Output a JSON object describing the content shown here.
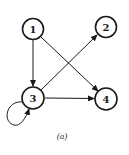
{
  "diagram": {
    "type": "directed-graph",
    "caption": "(a)",
    "colors": {
      "stroke": "#1a1a1a",
      "background": "#ffffff"
    },
    "nodes": [
      {
        "id": "1",
        "label": "1",
        "x": 33,
        "y": 29
      },
      {
        "id": "2",
        "label": "2",
        "x": 106,
        "y": 27
      },
      {
        "id": "3",
        "label": "3",
        "x": 33,
        "y": 98
      },
      {
        "id": "4",
        "label": "4",
        "x": 106,
        "y": 99
      }
    ],
    "edges": [
      {
        "from": "1",
        "to": "3"
      },
      {
        "from": "1",
        "to": "4"
      },
      {
        "from": "3",
        "to": "2"
      },
      {
        "from": "3",
        "to": "4"
      },
      {
        "from": "3",
        "to": "3",
        "self_loop": true
      }
    ]
  }
}
